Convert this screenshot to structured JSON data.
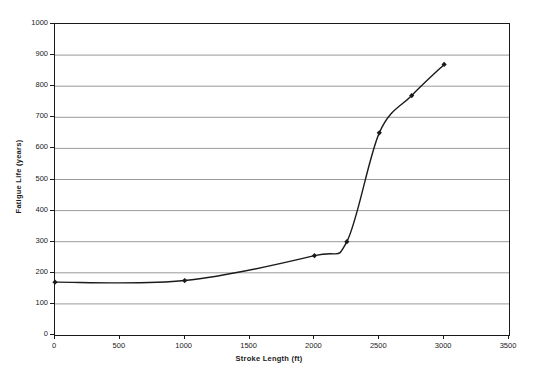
{
  "chart_data": {
    "type": "line",
    "title": "",
    "xlabel": "Stroke Length (ft)",
    "ylabel": "Fatigue Life (years)",
    "xlim": [
      0,
      3500
    ],
    "ylim": [
      0,
      1000
    ],
    "xticks": [
      0,
      500,
      1000,
      1500,
      2000,
      2500,
      3000,
      3500
    ],
    "yticks": [
      0,
      100,
      200,
      300,
      400,
      500,
      600,
      700,
      800,
      900,
      1000
    ],
    "xtick_labels": [
      "0",
      "500",
      "1000",
      "1500",
      "2000",
      "2500",
      "3000",
      "3500"
    ],
    "ytick_labels": [
      "0",
      "100",
      "200",
      "300",
      "400",
      "500",
      "600",
      "700",
      "800",
      "900",
      "1000"
    ],
    "grid": true,
    "grid_axis": "y",
    "legend": false,
    "marker": "diamond",
    "line_color": "#1a1a1a",
    "grid_color": "#808080",
    "series": [
      {
        "name": "Fatigue Life vs Stroke Length",
        "x": [
          0,
          1000,
          2000,
          2250,
          2500,
          2750,
          3000
        ],
        "values": [
          170,
          175,
          255,
          300,
          650,
          770,
          870
        ]
      }
    ]
  }
}
